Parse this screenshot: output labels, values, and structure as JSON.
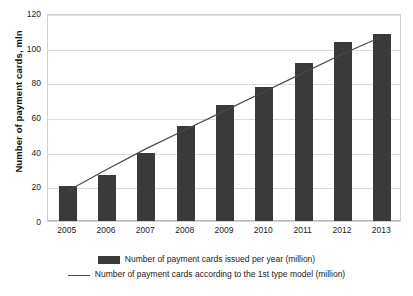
{
  "chart_data": {
    "type": "bar",
    "title": "",
    "xlabel": "",
    "ylabel": "Number of payment cards, mln",
    "categories": [
      "2005",
      "2006",
      "2007",
      "2008",
      "2009",
      "2010",
      "2011",
      "2012",
      "2013"
    ],
    "ylim": [
      0,
      120
    ],
    "yticks": [
      0,
      20,
      40,
      60,
      80,
      100,
      120
    ],
    "ytick_labels": [
      "0",
      "20",
      "40",
      "60",
      "80",
      "100",
      "120"
    ],
    "grid": true,
    "legend_position": "bottom",
    "series": [
      {
        "name": "Number of payment cards issued per year (million)",
        "type": "bar",
        "color": "#3a3a3a",
        "values": [
          20,
          26.5,
          39.5,
          55,
          67,
          77.5,
          91,
          103,
          108
        ]
      },
      {
        "name": "Number of payment cards according to the 1st type model (million)",
        "type": "line",
        "color": "#4a4a4a",
        "values": [
          17.5,
          30,
          42,
          53,
          64,
          75,
          86,
          97,
          107
        ]
      }
    ]
  },
  "axes": {
    "y_title": "Number of payment cards, mln"
  },
  "legend": {
    "items": [
      {
        "marker": "bar-swatch",
        "label": "Number of payment cards issued per year (million)"
      },
      {
        "marker": "line-glyph",
        "label": "Number of payment cards according to the 1st type model (million)"
      }
    ]
  }
}
